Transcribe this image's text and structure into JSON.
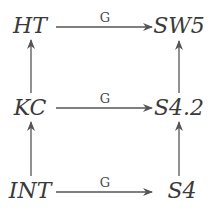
{
  "diagram": {
    "type": "commutative-diagram",
    "nodes": {
      "top_left": "HT",
      "top_right": "SW5",
      "mid_left": "KC",
      "mid_right": "S4.2",
      "bottom_left": "INT",
      "bottom_right": "S4"
    },
    "horizontal_arrow_labels": {
      "top": "G",
      "mid": "G",
      "bottom": "G"
    },
    "edges": [
      {
        "from": "HT",
        "to": "SW5",
        "label": "G",
        "direction": "right"
      },
      {
        "from": "KC",
        "to": "S4.2",
        "label": "G",
        "direction": "right"
      },
      {
        "from": "INT",
        "to": "S4",
        "label": "G",
        "direction": "right"
      },
      {
        "from": "KC",
        "to": "HT",
        "label": "",
        "direction": "up"
      },
      {
        "from": "INT",
        "to": "KC",
        "label": "",
        "direction": "up"
      },
      {
        "from": "S4.2",
        "to": "SW5",
        "label": "",
        "direction": "up"
      },
      {
        "from": "S4",
        "to": "S4.2",
        "label": "",
        "direction": "up"
      }
    ],
    "colors": {
      "text": "#3a3a3a",
      "arrow": "#555555",
      "background": "#ffffff"
    }
  }
}
